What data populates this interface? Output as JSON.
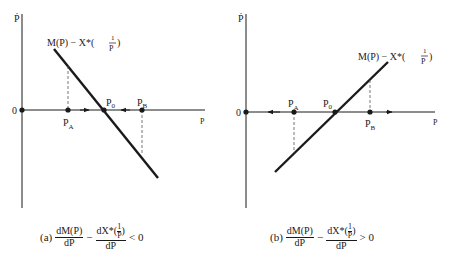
{
  "panels": [
    {
      "id": "a",
      "y_axis_label": "Ṗ",
      "x_axis_label": "P",
      "origin_label": "0",
      "curve_label": "M(P) − X*(1/P)",
      "curve_label_main": "M(P) − X*(",
      "curve_label_frac_num": "1",
      "curve_label_frac_den": "P",
      "curve_label_close": ")",
      "points": {
        "pa": "P",
        "pa_sub": "A",
        "p0": "P",
        "p0_sub": "0",
        "pb": "P",
        "pb_sub": "B"
      },
      "slope": "negative",
      "stability": "stable",
      "caption": {
        "tag": "(a)",
        "term1_num": "dM(P)",
        "term1_den": "dP",
        "minus": "−",
        "term2_num_pre": "dX*(",
        "term2_num_frac_num": "1",
        "term2_num_frac_den": "P",
        "term2_num_post": ")",
        "term2_den": "dP",
        "relation": "< 0"
      }
    },
    {
      "id": "b",
      "y_axis_label": "Ṗ",
      "x_axis_label": "P",
      "origin_label": "0",
      "curve_label": "M(P) − X*(1/P)",
      "curve_label_main": "M(P) − X*(",
      "curve_label_frac_num": "1",
      "curve_label_frac_den": "P",
      "curve_label_close": ")",
      "points": {
        "pa": "P",
        "pa_sub": "A",
        "p0": "P",
        "p0_sub": "0",
        "pb": "P",
        "pb_sub": "B"
      },
      "slope": "positive",
      "stability": "unstable",
      "caption": {
        "tag": "(b)",
        "term1_num": "dM(P)",
        "term1_den": "dP",
        "minus": "−",
        "term2_num_pre": "dX*(",
        "term2_num_frac_num": "1",
        "term2_num_frac_den": "P",
        "term2_num_post": ")",
        "term2_den": "dP",
        "relation": "> 0"
      }
    }
  ]
}
